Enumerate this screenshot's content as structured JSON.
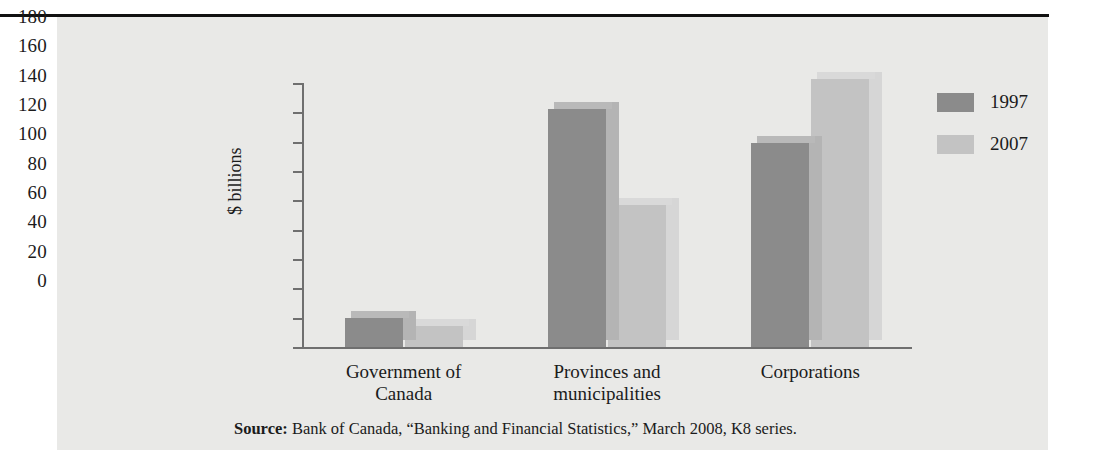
{
  "chart_data": {
    "type": "bar",
    "title": "",
    "xlabel": "",
    "ylabel": "$ billions",
    "ylim": [
      0,
      180
    ],
    "yticks": [
      180,
      160,
      140,
      120,
      100,
      80,
      60,
      40,
      20,
      0
    ],
    "grid": false,
    "legend_position": "right",
    "categories": [
      "Government of\nCanada",
      "Provinces and\nmunicipalities",
      "Corporations"
    ],
    "category_lines": [
      [
        "Government of",
        "Canada"
      ],
      [
        "Provinces and",
        "municipalities"
      ],
      [
        "Corporations"
      ]
    ],
    "series": [
      {
        "name": "1997",
        "color": "#8b8b8b",
        "values": [
          20,
          162,
          139
        ]
      },
      {
        "name": "2007",
        "color": "#c3c3c3",
        "values": [
          14,
          97,
          183
        ]
      }
    ]
  },
  "legend": {
    "items": [
      {
        "label": "1997"
      },
      {
        "label": "2007"
      }
    ]
  },
  "source": {
    "label": "Source:",
    "text": " Bank of Canada, “Banking and Financial Statistics,” March 2008, K8 series."
  },
  "colors": {
    "panel_background": "#e9e9e7",
    "axis": "#6f6f6f",
    "text": "#1b1b1b",
    "rule": "#111111",
    "series_1997": "#8b8b8b",
    "series_2007": "#c3c3c3"
  }
}
